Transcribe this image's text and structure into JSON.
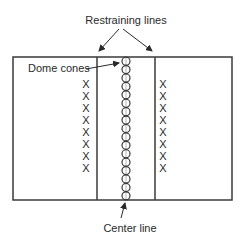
{
  "diagram": {
    "labels": {
      "restraining_lines": "Restraining lines",
      "dome_cones": "Dome cones",
      "center_line": "Center line"
    },
    "marker_glyph": "X",
    "colors": {
      "line": "#3a3a3a",
      "text": "#2a2a2a",
      "background": "#ffffff"
    },
    "field": {
      "left": 13,
      "top": 57,
      "right": 232,
      "bottom": 200
    },
    "restraining_lines_x": [
      97,
      155
    ],
    "center_line_x": 126,
    "dome_cone_count": 17,
    "players_per_side": 8,
    "left_players_x": 86,
    "right_players_x": 163,
    "player_rows_y": [
      88,
      100,
      112,
      124,
      136,
      148,
      160,
      172
    ]
  }
}
